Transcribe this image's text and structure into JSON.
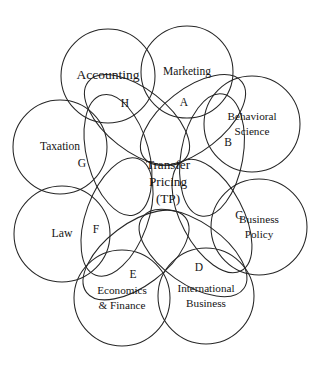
{
  "diagram": {
    "center": {
      "line1": "Transfer",
      "line2": "Pricing",
      "line3": "(TP)"
    },
    "colors": {
      "background": "#ffffff",
      "stroke": "#262626",
      "text": "#141414"
    },
    "disciplines": [
      {
        "id": "accounting",
        "label_line1": "Accounting",
        "label_line2": "",
        "font_size": 13.5,
        "cx": 108,
        "cy": 76,
        "r": 47
      },
      {
        "id": "marketing",
        "label_line1": "Marketing",
        "label_line2": "",
        "font_size": 11.5,
        "cx": 187,
        "cy": 72,
        "r": 46
      },
      {
        "id": "behavioral-science",
        "label_line1": "Behavioral",
        "label_line2": "Science",
        "font_size": 11.2,
        "cx": 252,
        "cy": 124,
        "r": 48
      },
      {
        "id": "business-policy",
        "label_line1": "Business",
        "label_line2": "Policy",
        "font_size": 11.2,
        "cx": 259,
        "cy": 227,
        "r": 48
      },
      {
        "id": "international-business",
        "label_line1": "International",
        "label_line2": "Business",
        "font_size": 11.2,
        "cx": 206,
        "cy": 296,
        "r": 48
      },
      {
        "id": "economics-finance",
        "label_line1": "Economics",
        "label_line2": "& Finance",
        "font_size": 11.2,
        "cx": 122,
        "cy": 298,
        "r": 48
      },
      {
        "id": "law",
        "label_line1": "Law",
        "label_line2": "",
        "font_size": 11.8,
        "cx": 62,
        "cy": 234,
        "r": 48
      },
      {
        "id": "taxation",
        "label_line1": "Taxation",
        "label_line2": "",
        "font_size": 11.5,
        "cx": 60,
        "cy": 147,
        "r": 47
      }
    ],
    "segments": [
      {
        "id": "segment-a",
        "letter": "A",
        "lx": 184,
        "ly": 103,
        "ecx": 193,
        "ecy": 120,
        "rx": 62,
        "ry": 31,
        "rot": -38
      },
      {
        "id": "segment-b",
        "letter": "B",
        "lx": 228,
        "ly": 143,
        "ecx": 212,
        "ecy": 155,
        "rx": 62,
        "ry": 31,
        "rot": -80
      },
      {
        "id": "segment-c",
        "letter": "C",
        "lx": 239,
        "ly": 216,
        "ecx": 212,
        "ecy": 216,
        "rx": 62,
        "ry": 31,
        "rot": -118
      },
      {
        "id": "segment-d",
        "letter": "D",
        "lx": 199,
        "ly": 268,
        "ecx": 193,
        "ecy": 253,
        "rx": 62,
        "ry": 31,
        "rot": -145
      },
      {
        "id": "segment-e",
        "letter": "E",
        "lx": 133,
        "ly": 275,
        "ecx": 136,
        "ecy": 255,
        "rx": 62,
        "ry": 31,
        "rot": 143
      },
      {
        "id": "segment-f",
        "letter": "F",
        "lx": 96,
        "ly": 230,
        "ecx": 117,
        "ecy": 217,
        "rx": 62,
        "ry": 31,
        "rot": 110
      },
      {
        "id": "segment-g",
        "letter": "G",
        "lx": 82,
        "ly": 164,
        "ecx": 118,
        "ecy": 155,
        "rx": 62,
        "ry": 31,
        "rot": 75
      },
      {
        "id": "segment-h",
        "letter": "H",
        "lx": 125,
        "ly": 104,
        "ecx": 137,
        "ecy": 120,
        "rx": 62,
        "ry": 31,
        "rot": 38
      }
    ]
  }
}
